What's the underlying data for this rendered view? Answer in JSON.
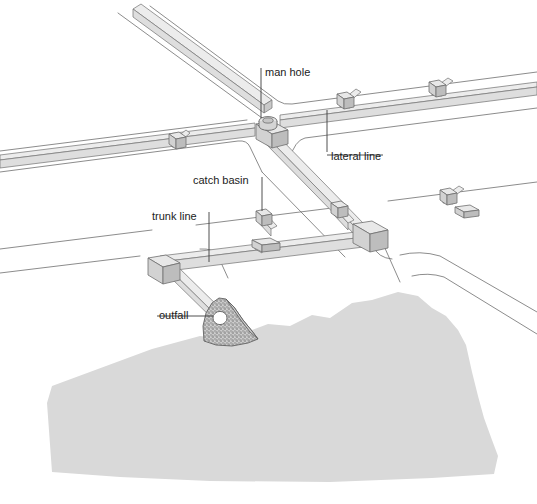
{
  "diagram": {
    "type": "engineering-isometric-illustration",
    "background_color": "#ffffff"
  },
  "labels": [
    {
      "id": "man-hole",
      "text": "man hole",
      "x": 263,
      "y": 76,
      "leader": "vertical line down to manhole structure at street intersection"
    },
    {
      "id": "lateral-line",
      "text": "lateral line",
      "x": 330,
      "y": 160,
      "leader": "vertical line up to lateral pipe branch"
    },
    {
      "id": "catch-basin",
      "text": "catch basin",
      "x": 193,
      "y": 184,
      "leader": "vertical line down to catch basin inlet box"
    },
    {
      "id": "trunk-line",
      "text": "trunk line",
      "x": 152,
      "y": 220,
      "leader": "vertical line down to main trunk pipe"
    },
    {
      "id": "outfall",
      "text": "outfall",
      "x": 159,
      "y": 318,
      "leader": "horizontal line right to outfall headwall opening"
    }
  ],
  "components": {
    "water_body": {
      "name": "receiving water",
      "color": "#d9d9d9",
      "description": "large irregular shaded area at bottom representing body of water"
    },
    "headwall": {
      "name": "outfall headwall",
      "color": "#c4c4c4",
      "texture": "stippled concrete",
      "description": "triangular stippled concrete structure with circular pipe opening"
    },
    "pipes": {
      "fill_color": "#dedede",
      "stroke_color": "#7a7a7a",
      "description": "isometric rectangular prism pipes forming trunk and lateral network"
    },
    "roads": {
      "stroke_color": "#6e6e6e",
      "description": "thin outlined street curb lines crossing the scene"
    },
    "manhole": {
      "name": "manhole",
      "description": "cylindrical structure atop the pipe junction at main intersection"
    },
    "catch_basins": {
      "count": 7,
      "description": "small inlet boxes set along curb lines connecting to laterals"
    }
  },
  "colors": {
    "label_text": "#1b1b1b",
    "leader_line": "#3c3c3c",
    "water": "#d9d9d9",
    "pipe_fill": "#dedede",
    "pipe_stroke": "#7a7a7a",
    "road_line": "#6e6e6e",
    "background": "#ffffff"
  }
}
